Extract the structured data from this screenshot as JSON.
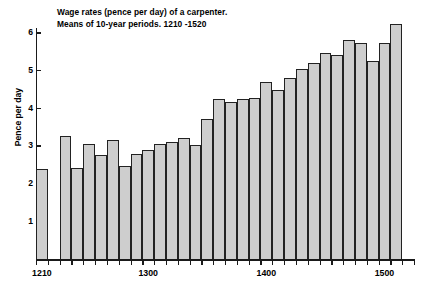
{
  "chart_data": {
    "type": "bar",
    "title": "Wage rates (pence per day) of a carpenter.",
    "subtitle": "Means of 10-year periods.  1210 -1520",
    "xlabel": "",
    "ylabel": "Pence per day",
    "ylim": [
      0,
      6.5
    ],
    "xlim": [
      1210,
      1530
    ],
    "grid": false,
    "legend": null,
    "bar_color": "#cecece",
    "bar_edge_color": "#222222",
    "axis_color": "#1a1a1a",
    "y_ticks": [
      1,
      2,
      3,
      4,
      5,
      6
    ],
    "y_tick_labels": [
      "1",
      "2",
      "3",
      "4",
      "5",
      "6"
    ],
    "x_tick_labels": [
      "1210",
      "1300",
      "1400",
      "1500"
    ],
    "x_tick_values": [
      1210,
      1300,
      1400,
      1500
    ],
    "note": "Decade bins; no bars plotted for the 1220s decade (gap after first bar).",
    "categories": [
      "1210",
      "1220",
      "1230",
      "1240",
      "1250",
      "1260",
      "1270",
      "1280",
      "1290",
      "1300",
      "1310",
      "1320",
      "1330",
      "1340",
      "1350",
      "1360",
      "1370",
      "1380",
      "1390",
      "1400",
      "1410",
      "1420",
      "1430",
      "1440",
      "1450",
      "1460",
      "1470",
      "1480",
      "1490",
      "1500",
      "1510",
      "1520"
    ],
    "values": [
      2.42,
      null,
      3.29,
      2.45,
      3.07,
      2.78,
      3.19,
      2.49,
      2.81,
      2.91,
      3.08,
      3.12,
      3.24,
      3.06,
      3.75,
      4.26,
      4.2,
      4.28,
      4.3,
      4.71,
      4.52,
      4.83,
      5.08,
      5.22,
      5.48,
      5.43,
      5.84,
      5.76,
      5.28,
      5.76,
      6.26,
      null
    ]
  }
}
